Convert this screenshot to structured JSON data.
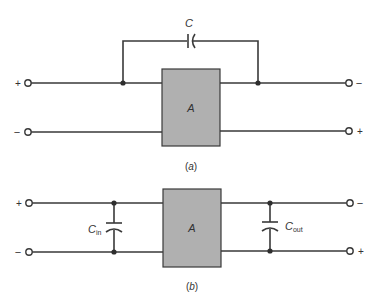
{
  "figure_a": {
    "capacitor_label": "C",
    "block_label": "A",
    "input_top_sign": "+",
    "input_bottom_sign": "−",
    "output_top_sign": "−",
    "output_bottom_sign": "+",
    "caption": "(a)"
  },
  "figure_b": {
    "cin_label": "C",
    "cin_sub": "in",
    "cout_label": "C",
    "cout_sub": "out",
    "block_label": "A",
    "input_top_sign": "+",
    "input_bottom_sign": "−",
    "output_top_sign": "−",
    "output_bottom_sign": "+",
    "caption": "(b)"
  },
  "colors": {
    "block_fill": "#b0b0b0",
    "wire": "#3a3a3a"
  }
}
